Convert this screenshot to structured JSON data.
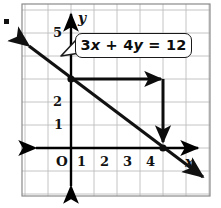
{
  "figure": {
    "kind": "coordinate-plane-graph",
    "bullet": "■",
    "frame": {
      "left": 22,
      "top": 4,
      "right": 210,
      "bottom": 196,
      "border_color": "#8c8c8c",
      "grid_color": "#b8b8b8",
      "background": "#ffffff"
    }
  },
  "callout": {
    "equation": "3x + 4y = 12",
    "parts": [
      {
        "t": "3",
        "italic": false
      },
      {
        "t": "x",
        "italic": true
      },
      {
        "t": " + ",
        "italic": false
      },
      {
        "t": "4",
        "italic": false
      },
      {
        "t": "y",
        "italic": true
      },
      {
        "t": " = 12",
        "italic": false
      }
    ],
    "border_color": "#1a1a1a",
    "fill_color": "#ffffff"
  },
  "axes": {
    "x_name": "x",
    "y_name": "y",
    "origin_label": "O",
    "x_ticks": [
      {
        "value": "1",
        "px": 80
      },
      {
        "value": "2",
        "px": 103
      },
      {
        "value": "3",
        "px": 126
      },
      {
        "value": "4",
        "px": 149
      }
    ],
    "y_ticks": [
      {
        "value": "1",
        "px": 125
      },
      {
        "value": "2",
        "px": 102
      },
      {
        "value": "5",
        "px": 33
      }
    ],
    "x_axis_y_px": 148,
    "y_axis_x_px": 71,
    "grid_step_px": 23,
    "axis_color": "#000000"
  },
  "chart_data": {
    "type": "line",
    "title": "3x + 4y = 12",
    "xlabel": "x",
    "ylabel": "y",
    "equation": "3x + 4y = 12",
    "slope": -0.75,
    "y_intercept": 3,
    "x_intercept": 4,
    "xlim": [
      -2,
      6
    ],
    "ylim": [
      -2,
      6
    ],
    "grid": true,
    "legend": "none",
    "series": [
      {
        "name": "3x + 4y = 12",
        "points": [
          [
            -2,
            4.5
          ],
          [
            0,
            3
          ],
          [
            4,
            0
          ],
          [
            6,
            -1.5
          ]
        ],
        "style": "solid-arrow-both-ends",
        "color": "#111111"
      }
    ],
    "marked_points": [
      {
        "label": "y-intercept",
        "x": 0,
        "y": 3
      },
      {
        "label": "x-intercept",
        "x": 4,
        "y": 0
      }
    ],
    "annotations": [
      {
        "kind": "arrow",
        "name": "run-arrow",
        "from": [
          0,
          3
        ],
        "to": [
          4,
          3
        ],
        "direction": "right"
      },
      {
        "kind": "arrow",
        "name": "rise-arrow",
        "from": [
          4,
          3
        ],
        "to": [
          4,
          0
        ],
        "direction": "down"
      },
      {
        "kind": "callout",
        "name": "equation-callout",
        "text": "3x + 4y = 12",
        "anchor": [
          0,
          3
        ]
      }
    ]
  }
}
